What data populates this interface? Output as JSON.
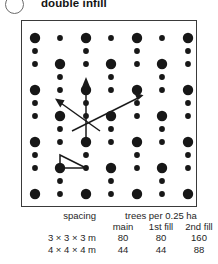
{
  "figure": {
    "bullet_icon": "circle-outline-icon",
    "title": "double infill"
  },
  "diagram": {
    "name": "triangular-planting-lattice",
    "main_dot_label": "main tree",
    "infill_dot_label": "infill tree",
    "arrow_label": "spacing direction arrow",
    "unit_triangle_label": "planting unit triangle"
  },
  "table": {
    "spacing_header": "spacing",
    "trees_group_header": "trees per 0.25 ha",
    "columns": [
      "main",
      "1st fill",
      "2nd fill"
    ],
    "rows": [
      {
        "spacing": "3 × 3 × 3 m",
        "main": "80",
        "first_fill": "80",
        "second_fill": "160"
      },
      {
        "spacing": "4 × 4 × 4 m",
        "main": "44",
        "first_fill": "44",
        "second_fill": "88"
      }
    ]
  },
  "colors": {
    "ink": "#1a1a1a",
    "frame": "#3a3a3a",
    "dot": "#171717",
    "background": "#ffffff"
  }
}
